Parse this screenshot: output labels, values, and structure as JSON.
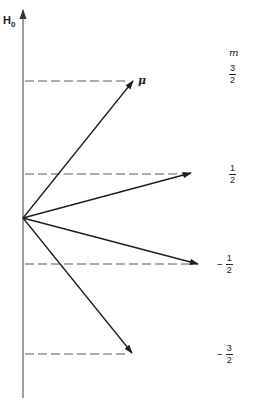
{
  "axis": {
    "label": "H",
    "subscript": "0",
    "origin": [
      23,
      218
    ],
    "top": [
      23,
      8
    ],
    "bottom": [
      23,
      398
    ]
  },
  "vector_label": "μ",
  "m_header": "m",
  "levels": [
    {
      "sign": "",
      "numerator": "3",
      "denominator": "2",
      "y": 81,
      "tip": [
        134,
        80
      ],
      "label_y": 63
    },
    {
      "sign": "",
      "numerator": "1",
      "denominator": "2",
      "y": 174,
      "tip": [
        191,
        172
      ],
      "label_y": 163
    },
    {
      "sign": "−",
      "numerator": "1",
      "denominator": "2",
      "y": 264,
      "tip": [
        198,
        264
      ],
      "label_y": 253
    },
    {
      "sign": "−",
      "numerator": "3",
      "denominator": "2",
      "y": 354,
      "tip": [
        132,
        354
      ],
      "label_y": 344
    }
  ],
  "colors": {
    "line": "#1e1e1e",
    "dash": "#5a5a5a",
    "axis": "#6a6a6a",
    "background": "#ffffff"
  }
}
